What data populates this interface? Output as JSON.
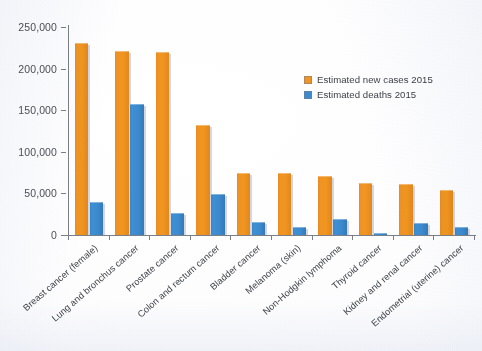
{
  "chart_data": {
    "type": "bar",
    "title": "",
    "subtitle": "",
    "xlabel": "",
    "ylabel": "",
    "ylim": [
      0,
      250000
    ],
    "ytick_labels": [
      "250,000",
      "200,000",
      "150,000",
      "100,000",
      "50,000",
      "0"
    ],
    "ytick_values": [
      250000,
      200000,
      150000,
      100000,
      50000,
      0
    ],
    "grid": false,
    "legend_position": "upper right inside plot",
    "categories": [
      "Breast cancer (female)",
      "Lung and bronchus cancer",
      "Prostate cancer",
      "Colon and rectum cancer",
      "Bladder cancer",
      "Melanoma (skin)",
      "Non-Hodgkin lymphoma",
      "Thyroid cancer",
      "Kidney and renal cancer",
      "Endometrial (uterine) cancer"
    ],
    "series": [
      {
        "name": "Estimated new cases 2015",
        "color": "#ef9324",
        "values": [
          231000,
          221000,
          220000,
          132000,
          74000,
          74000,
          71000,
          62000,
          61000,
          54000
        ]
      },
      {
        "name": "Estimated deaths 2015",
        "color": "#3c8ace",
        "values": [
          40000,
          158000,
          27000,
          49000,
          16000,
          10000,
          19000,
          2000,
          14000,
          10000
        ]
      }
    ]
  },
  "legend": {
    "items": [
      {
        "label": "Estimated new cases 2015",
        "swatch": "orange-swatch"
      },
      {
        "label": "Estimated deaths 2015",
        "swatch": "blue-swatch"
      }
    ]
  },
  "axes": {
    "y": {
      "max_label": "250,000",
      "min_label": "0"
    }
  }
}
